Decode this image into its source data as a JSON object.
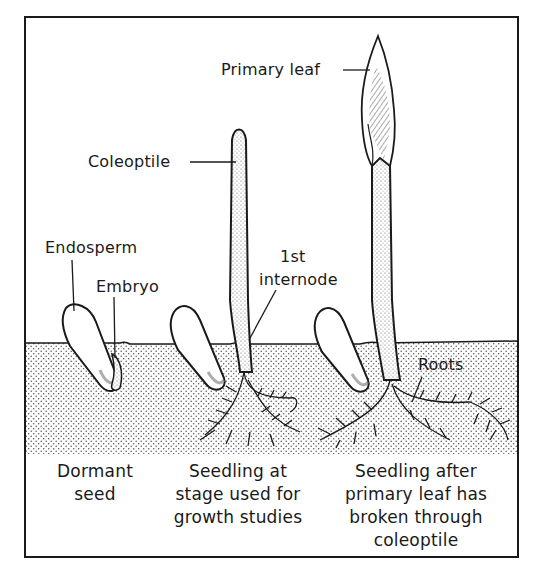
{
  "figure": {
    "colors": {
      "ink": "#1a1a1a",
      "paper": "#ffffff",
      "soil_dot": "#555555"
    },
    "labels": {
      "primary_leaf": "Primary leaf",
      "coleoptile": "Coleoptile",
      "endosperm": "Endosperm",
      "embryo": "Embryo",
      "first_internode": "1st\ninternode",
      "first_internode_line1": "1st",
      "first_internode_line2": "internode",
      "roots": "Roots"
    },
    "captions": [
      {
        "stage": "dormant",
        "text": "Dormant\nseed"
      },
      {
        "stage": "seedling",
        "text": "Seedling at\nstage used for\ngrowth studies"
      },
      {
        "stage": "seedling-after",
        "text": "Seedling after\nprimary leaf has\nbroken through\ncoleoptile"
      }
    ]
  }
}
